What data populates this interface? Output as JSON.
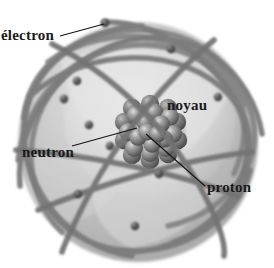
{
  "figure": {
    "language": "fr",
    "background_color": "#ffffff"
  },
  "labels": {
    "electron": "électron",
    "noyau": "noyau",
    "neutron": "neutron",
    "proton": "proton"
  },
  "colors": {
    "sphere_fill": "#c0c0c0",
    "sphere_shade": "#a8a8a8",
    "sphere_highlight": "#dcdcdc",
    "orbit_stroke": "#808080",
    "orbit_stroke_dark": "#6e6e6e",
    "electron_dot": "#4a4a4a",
    "nucleon_base": "#6f6f6f",
    "nucleon_highlight": "#d2d2d2",
    "leader_line": "#111111",
    "text": "#1a1a1a"
  },
  "geometry": {
    "sphere_center": [
      138,
      142
    ],
    "sphere_radius_x": 120,
    "sphere_radius_y": 120,
    "nucleus_center": [
      152,
      130
    ],
    "nucleus_radius": 32,
    "electron_count": 9,
    "orbit_count": 9
  }
}
